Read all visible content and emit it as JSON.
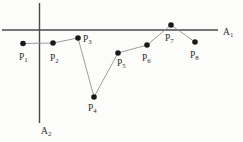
{
  "diagram": {
    "width": 243,
    "height": 142,
    "point_radius": 2.8,
    "colors": {
      "background": "#fcfcfb",
      "axis": "#4a4a4a",
      "connector": "#929292",
      "point": "#1a1a1a",
      "text": "#2b2b2b"
    },
    "axes": [
      {
        "label": "A",
        "sub": "1",
        "x1": 2,
        "y1": 30,
        "x2": 218,
        "y2": 30,
        "label_x": 223,
        "label_y": 35
      },
      {
        "label": "A",
        "sub": "2",
        "x1": 39.5,
        "y1": 3,
        "x2": 39.5,
        "y2": 123,
        "label_x": 41,
        "label_y": 134
      }
    ],
    "points": [
      {
        "label": "P",
        "sub": "1",
        "x": 23,
        "y": 43.5,
        "label_x": 19,
        "label_y": 60
      },
      {
        "label": "P",
        "sub": "2",
        "x": 53,
        "y": 43,
        "label_x": 50,
        "label_y": 61
      },
      {
        "label": "P",
        "sub": "3",
        "x": 78,
        "y": 38,
        "label_x": 83,
        "label_y": 42
      },
      {
        "label": "P",
        "sub": "4",
        "x": 94,
        "y": 97,
        "label_x": 88,
        "label_y": 111
      },
      {
        "label": "P",
        "sub": "5",
        "x": 118,
        "y": 53,
        "label_x": 117,
        "label_y": 66
      },
      {
        "label": "P",
        "sub": "6",
        "x": 147,
        "y": 45,
        "label_x": 142,
        "label_y": 61
      },
      {
        "label": "P",
        "sub": "7",
        "x": 171,
        "y": 25,
        "label_x": 165,
        "label_y": 41
      },
      {
        "label": "P",
        "sub": "8",
        "x": 195,
        "y": 42,
        "label_x": 190,
        "label_y": 58
      }
    ]
  }
}
